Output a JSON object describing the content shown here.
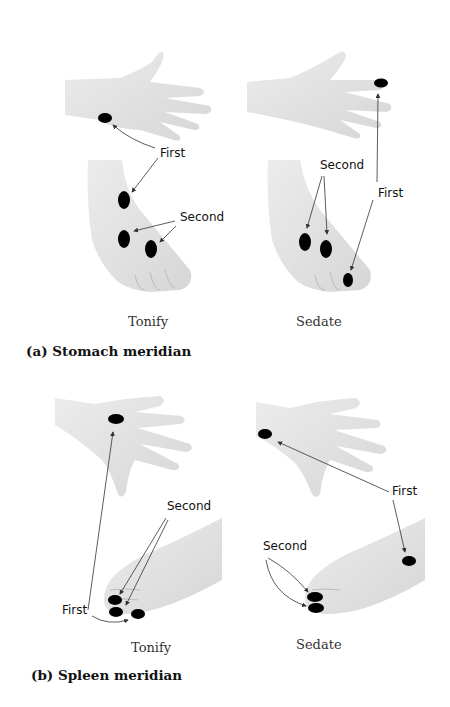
{
  "figure": {
    "sections": [
      {
        "id": "a",
        "title": "(a) Stomach meridian",
        "panels": [
          {
            "caption": "Tonify",
            "labels": {
              "first": "First",
              "second": "Second"
            }
          },
          {
            "caption": "Sedate",
            "labels": {
              "first": "First",
              "second": "Second"
            }
          }
        ]
      },
      {
        "id": "b",
        "title": "(b) Spleen meridian",
        "panels": [
          {
            "caption": "Tonify",
            "labels": {
              "first": "First",
              "second": "Second"
            }
          },
          {
            "caption": "Sedate",
            "labels": {
              "first": "First",
              "second": "Second"
            }
          }
        ]
      }
    ],
    "colors": {
      "point": "#000000",
      "skin": "#e4e4e4",
      "skin_shadow": "#cfcfcf",
      "arrow": "#333333"
    }
  }
}
